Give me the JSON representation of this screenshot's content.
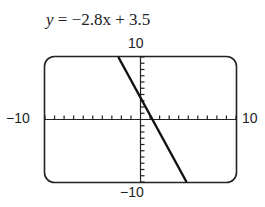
{
  "equation": {
    "lhs": "y",
    "eq": " = ",
    "rhs": "−2.8x + 3.5"
  },
  "labels": {
    "ymax": "10",
    "ymin": "−10",
    "xmin": "−10",
    "xmax": "10"
  },
  "chart_data": {
    "type": "line",
    "title": "y = −2.8x + 3.5",
    "function": "y = -2.8x + 3.5",
    "slope": -2.8,
    "intercept": 3.5,
    "xlim": [
      -10,
      10
    ],
    "ylim": [
      -10,
      10
    ],
    "xscale": 1,
    "yscale": 1,
    "x_tick_labels": [
      "−10",
      "10"
    ],
    "y_tick_labels": [
      "10",
      "−10"
    ],
    "grid": false,
    "series": [
      {
        "name": "y = -2.8x + 3.5",
        "x": [
          -2.32,
          0,
          1.25,
          4.82
        ],
        "y": [
          10,
          3.5,
          0,
          -10
        ]
      }
    ]
  }
}
